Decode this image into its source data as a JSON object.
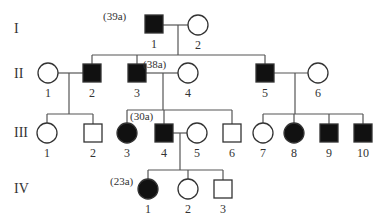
{
  "generations": [
    {
      "label": "I",
      "y": 33
    },
    {
      "label": "II",
      "y": 78
    },
    {
      "label": "III",
      "y": 137
    },
    {
      "label": "IV",
      "y": 193
    }
  ],
  "individuals": [
    {
      "id": "I-1",
      "label": "1",
      "sex": "male",
      "affected": true,
      "cx": 154,
      "cy": 24,
      "age": "(39a)",
      "age_x": 103,
      "age_y": 20
    },
    {
      "id": "I-2",
      "label": "2",
      "sex": "female",
      "affected": false,
      "cx": 198,
      "cy": 25
    },
    {
      "id": "II-1",
      "label": "1",
      "sex": "female",
      "affected": false,
      "cx": 48,
      "cy": 73
    },
    {
      "id": "II-2",
      "label": "2",
      "sex": "male",
      "affected": true,
      "cx": 92,
      "cy": 73
    },
    {
      "id": "II-3",
      "label": "3",
      "sex": "male",
      "affected": true,
      "cx": 137,
      "cy": 73,
      "age": "(38a)",
      "age_x": 143,
      "age_y": 68
    },
    {
      "id": "II-4",
      "label": "4",
      "sex": "female",
      "affected": false,
      "cx": 188,
      "cy": 73
    },
    {
      "id": "II-5",
      "label": "5",
      "sex": "male",
      "affected": true,
      "cx": 265,
      "cy": 73
    },
    {
      "id": "II-6",
      "label": "6",
      "sex": "female",
      "affected": false,
      "cx": 318,
      "cy": 73
    },
    {
      "id": "III-1",
      "label": "1",
      "sex": "female",
      "affected": false,
      "cx": 47,
      "cy": 133
    },
    {
      "id": "III-2",
      "label": "2",
      "sex": "male",
      "affected": false,
      "cx": 93,
      "cy": 133
    },
    {
      "id": "III-3",
      "label": "3",
      "sex": "female",
      "affected": true,
      "cx": 127,
      "cy": 133
    },
    {
      "id": "III-4",
      "label": "4",
      "sex": "male",
      "affected": true,
      "cx": 164,
      "cy": 133,
      "age": "(30a)",
      "age_x": 130,
      "age_y": 120
    },
    {
      "id": "III-5",
      "label": "5",
      "sex": "female",
      "affected": false,
      "cx": 197,
      "cy": 133
    },
    {
      "id": "III-6",
      "label": "6",
      "sex": "male",
      "affected": false,
      "cx": 232,
      "cy": 133
    },
    {
      "id": "III-7",
      "label": "7",
      "sex": "female",
      "affected": false,
      "cx": 263,
      "cy": 133
    },
    {
      "id": "III-8",
      "label": "8",
      "sex": "female",
      "affected": true,
      "cx": 294,
      "cy": 133
    },
    {
      "id": "III-9",
      "label": "9",
      "sex": "male",
      "affected": true,
      "cx": 329,
      "cy": 133
    },
    {
      "id": "III-10",
      "label": "10",
      "sex": "male",
      "affected": true,
      "cx": 363,
      "cy": 133
    },
    {
      "id": "IV-1",
      "label": "1",
      "sex": "female",
      "affected": true,
      "cx": 148,
      "cy": 189,
      "age": "(23a)",
      "age_x": 110,
      "age_y": 185
    },
    {
      "id": "IV-2",
      "label": "2",
      "sex": "female",
      "affected": false,
      "cx": 188,
      "cy": 189
    },
    {
      "id": "IV-3",
      "label": "3",
      "sex": "male",
      "affected": false,
      "cx": 223,
      "cy": 189
    }
  ],
  "lines": [
    [
      163,
      25,
      188,
      25
    ],
    [
      178,
      25,
      178,
      55
    ],
    [
      92,
      55,
      265,
      55
    ],
    [
      92,
      55,
      92,
      64
    ],
    [
      137,
      55,
      137,
      64
    ],
    [
      265,
      55,
      265,
      64
    ],
    [
      58,
      73,
      83,
      73
    ],
    [
      69,
      73,
      69,
      114
    ],
    [
      47,
      114,
      93,
      114
    ],
    [
      47,
      114,
      47,
      123
    ],
    [
      93,
      114,
      93,
      124
    ],
    [
      146,
      73,
      178,
      73
    ],
    [
      163,
      73,
      163,
      110
    ],
    [
      127,
      110,
      232,
      110
    ],
    [
      127,
      110,
      127,
      123
    ],
    [
      164,
      110,
      164,
      124
    ],
    [
      232,
      110,
      232,
      124
    ],
    [
      274,
      73,
      308,
      73
    ],
    [
      295,
      73,
      295,
      114
    ],
    [
      263,
      114,
      363,
      114
    ],
    [
      263,
      114,
      263,
      123
    ],
    [
      294,
      114,
      294,
      123
    ],
    [
      329,
      114,
      329,
      124
    ],
    [
      363,
      114,
      363,
      124
    ],
    [
      173,
      133,
      187,
      133
    ],
    [
      180,
      133,
      180,
      170
    ],
    [
      148,
      170,
      223,
      170
    ],
    [
      148,
      170,
      148,
      179
    ],
    [
      188,
      170,
      188,
      179
    ],
    [
      223,
      170,
      223,
      180
    ]
  ],
  "style": {
    "affected_fill": "#111111",
    "unaffected_fill": "#ffffff",
    "stroke": "#333333"
  }
}
